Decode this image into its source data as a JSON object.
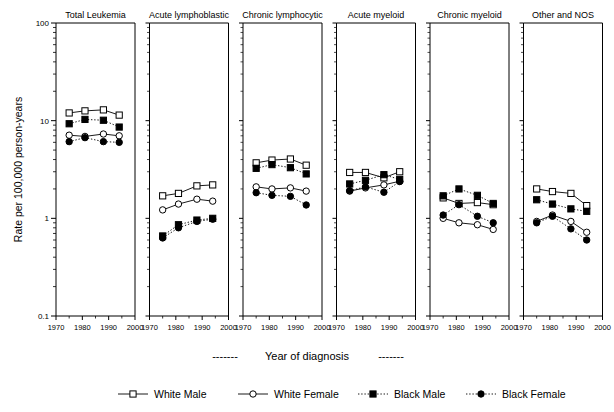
{
  "chart_data": {
    "type": "line",
    "title": "",
    "xlabel": "-------  Year of diagnosis  -------",
    "ylabel": "Rate per 100,000 person-years",
    "yscale": "log",
    "ylim": [
      0.1,
      100
    ],
    "ytick_labels": [
      "100",
      "10",
      "1",
      "0.1"
    ],
    "ytick_values": [
      100,
      10,
      1,
      0.1
    ],
    "xlim": [
      1970,
      2000
    ],
    "xtick_labels": [
      "1970",
      "1980",
      "1990",
      "2000"
    ],
    "xtick_values": [
      1970,
      1980,
      1990,
      2000
    ],
    "grid": false,
    "legend_position": "bottom",
    "x": [
      1975,
      1981,
      1988,
      1994
    ],
    "legend": [
      {
        "name": "White Male",
        "marker": "open-square",
        "line": "solid",
        "color": "#000000"
      },
      {
        "name": "White Female",
        "marker": "open-circle",
        "line": "solid",
        "color": "#000000"
      },
      {
        "name": "Black Male",
        "marker": "filled-square",
        "line": "dotted",
        "color": "#000000"
      },
      {
        "name": "Black Female",
        "marker": "filled-circle",
        "line": "dotted",
        "color": "#000000"
      }
    ],
    "panels": [
      {
        "title": "Total Leukemia",
        "series": [
          {
            "name": "White Male",
            "values": [
              12.0,
              12.6,
              12.9,
              11.4
            ]
          },
          {
            "name": "White Female",
            "values": [
              7.1,
              6.9,
              7.3,
              7.0
            ]
          },
          {
            "name": "Black Male",
            "values": [
              9.3,
              10.3,
              10.1,
              8.6
            ]
          },
          {
            "name": "Black Female",
            "values": [
              6.1,
              6.7,
              6.1,
              6.0
            ]
          }
        ]
      },
      {
        "title": "Acute lymphoblastic",
        "series": [
          {
            "name": "White Male",
            "values": [
              1.7,
              1.8,
              2.15,
              2.2
            ]
          },
          {
            "name": "White Female",
            "values": [
              1.22,
              1.4,
              1.57,
              1.5
            ]
          },
          {
            "name": "Black Male",
            "values": [
              0.66,
              0.86,
              0.96,
              1.0
            ]
          },
          {
            "name": "Black Female",
            "values": [
              0.63,
              0.8,
              0.93,
              0.98
            ]
          }
        ]
      },
      {
        "title": "Chronic lymphocytic",
        "series": [
          {
            "name": "White Male",
            "values": [
              3.7,
              3.95,
              4.05,
              3.5
            ]
          },
          {
            "name": "White Female",
            "values": [
              2.1,
              2.0,
              2.05,
              1.9
            ]
          },
          {
            "name": "Black Male",
            "values": [
              3.25,
              3.55,
              3.3,
              2.85
            ]
          },
          {
            "name": "Black Female",
            "values": [
              1.83,
              1.72,
              1.68,
              1.37
            ]
          }
        ]
      },
      {
        "title": "Acute myeloid",
        "series": [
          {
            "name": "White Male",
            "values": [
              2.95,
              2.95,
              2.6,
              3.0
            ]
          },
          {
            "name": "White Female",
            "values": [
              1.9,
              2.05,
              2.2,
              2.4
            ]
          },
          {
            "name": "Black Male",
            "values": [
              2.25,
              2.45,
              2.8,
              2.5
            ]
          },
          {
            "name": "Black Female",
            "values": [
              1.92,
              2.1,
              1.85,
              2.38
            ]
          }
        ]
      },
      {
        "title": "Chronic myeloid",
        "series": [
          {
            "name": "White Male",
            "values": [
              1.62,
              1.42,
              1.45,
              1.38
            ]
          },
          {
            "name": "White Female",
            "values": [
              1.0,
              0.9,
              0.86,
              0.77
            ]
          },
          {
            "name": "Black Male",
            "values": [
              1.7,
              2.0,
              1.72,
              1.42
            ]
          },
          {
            "name": "Black Female",
            "values": [
              1.08,
              1.38,
              1.05,
              0.9
            ]
          }
        ]
      },
      {
        "title": "Other and NOS",
        "series": [
          {
            "name": "White Male",
            "values": [
              2.0,
              1.88,
              1.8,
              1.35
            ]
          },
          {
            "name": "White Female",
            "values": [
              0.93,
              1.08,
              0.93,
              0.72
            ]
          },
          {
            "name": "Black Male",
            "values": [
              1.55,
              1.4,
              1.25,
              1.18
            ]
          },
          {
            "name": "Black Female",
            "values": [
              0.9,
              1.05,
              0.78,
              0.6
            ]
          }
        ]
      }
    ]
  },
  "axes": {
    "ylabel": "Rate per 100,000 person-years",
    "xlabel_prefix": "-------",
    "xlabel_text": "Year of diagnosis",
    "xlabel_suffix": "-------"
  },
  "legend_items": [
    {
      "label": "White Male"
    },
    {
      "label": "White Female"
    },
    {
      "label": "Black Male"
    },
    {
      "label": "Black Female"
    }
  ]
}
